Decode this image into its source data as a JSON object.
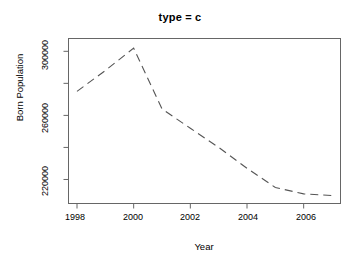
{
  "chart_data": {
    "type": "line",
    "title": "type = c",
    "xlabel": "Year",
    "ylabel": "Born Population",
    "x": [
      1998,
      1999,
      2000,
      2001,
      2002,
      2003,
      2004,
      2005,
      2006,
      2007
    ],
    "values": [
      275000,
      288000,
      302000,
      264000,
      252000,
      240000,
      227000,
      215000,
      211000,
      210000
    ],
    "series": [
      {
        "name": "Born Population",
        "values": [
          275000,
          288000,
          302000,
          264000,
          252000,
          240000,
          227000,
          215000,
          211000,
          210000
        ]
      }
    ],
    "xlim": [
      1997.7,
      2007.3
    ],
    "ylim": [
      205000,
      308000
    ],
    "xticks": [
      1998,
      2000,
      2002,
      2004,
      2006
    ],
    "xtick_labels": [
      "1998",
      "2000",
      "2002",
      "2004",
      "2006"
    ],
    "yticks": [
      220000,
      240000,
      260000,
      280000,
      300000
    ],
    "ytick_labels": [
      "220000",
      "",
      "260000",
      "",
      "300000"
    ],
    "ytick_labels_shown": [
      "220000",
      "260000",
      "300000"
    ],
    "grid": false,
    "legend": false,
    "legend_position": "none",
    "line_style": "dashed",
    "line_color": "#555555",
    "line_width": 1,
    "box": true,
    "background": "#ffffff"
  },
  "axes": {
    "y_tick_0_label": "220000",
    "y_tick_1_label": "260000",
    "y_tick_2_label": "300000",
    "x_tick_0_label": "1998",
    "x_tick_1_label": "2000",
    "x_tick_2_label": "2002",
    "x_tick_3_label": "2004",
    "x_tick_4_label": "2006"
  },
  "colors": {
    "axis": "#666666",
    "line": "#555555",
    "text": "#000000",
    "background": "#ffffff"
  }
}
